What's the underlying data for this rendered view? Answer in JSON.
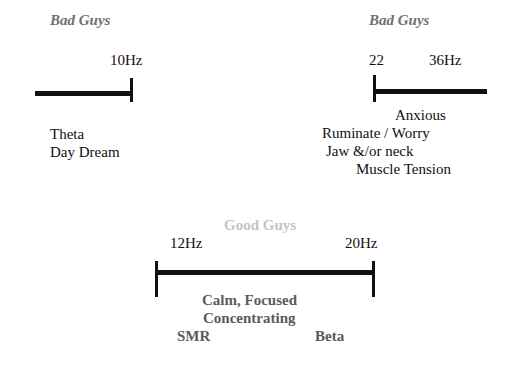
{
  "left_band": {
    "title": "Bad Guys",
    "freq_label": "10Hz",
    "descriptions": [
      "Theta",
      "Day Dream"
    ]
  },
  "right_band": {
    "title": "Bad Guys",
    "start_label": "22",
    "end_label": "36Hz",
    "descriptions": [
      "Anxious",
      "Ruminate / Worry",
      "Jaw &/or neck",
      "Muscle Tension"
    ]
  },
  "center_band": {
    "title": "Good Guys",
    "start_label": "12Hz",
    "end_label": "20Hz",
    "descriptions": [
      "Calm, Focused",
      "Concentrating"
    ],
    "left_name": "SMR",
    "right_name": "Beta"
  },
  "colors": {
    "bad_title": "#707070",
    "good_title": "#c4c4c4",
    "line": "#111111",
    "good_text": "#5a5a5a"
  }
}
